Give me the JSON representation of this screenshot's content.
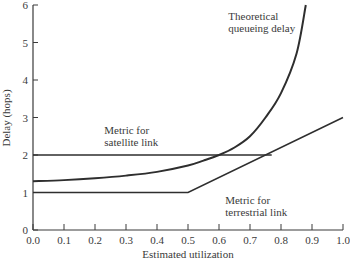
{
  "chart_data": {
    "type": "line",
    "title": "",
    "xlabel": "Estimated utilization",
    "ylabel": "Delay (hops)",
    "xlim": [
      0.0,
      1.0
    ],
    "ylim": [
      0,
      6
    ],
    "grid": false,
    "x_ticks": [
      "0.0",
      "0.1",
      "0.2",
      "0.3",
      "0.4",
      "0.5",
      "0.6",
      "0.7",
      "0.8",
      "0.9",
      "1.0"
    ],
    "y_ticks": [
      "0",
      "1",
      "2",
      "3",
      "4",
      "5",
      "6"
    ],
    "series": [
      {
        "name": "Theoretical queueing delay",
        "x": [
          0.0,
          0.1,
          0.2,
          0.3,
          0.4,
          0.5,
          0.55,
          0.6,
          0.65,
          0.7,
          0.75,
          0.8,
          0.85,
          0.88
        ],
        "values": [
          1.3,
          1.33,
          1.38,
          1.45,
          1.55,
          1.72,
          1.85,
          2.0,
          2.2,
          2.5,
          3.0,
          3.65,
          4.7,
          6.0
        ]
      },
      {
        "name": "Metric for satellite link",
        "x": [
          0.0,
          0.77
        ],
        "values": [
          2.0,
          2.0
        ]
      },
      {
        "name": "Metric for terrestrial link",
        "x": [
          0.0,
          0.5,
          1.0
        ],
        "values": [
          1.0,
          1.0,
          3.0
        ]
      }
    ],
    "annotations": [
      {
        "text": [
          "Theoretical",
          "queueing delay"
        ],
        "x": 0.63,
        "y": 5.6
      },
      {
        "text": [
          "Metric for",
          "satellite link"
        ],
        "x": 0.23,
        "y": 2.55
      },
      {
        "text": [
          "Metric for",
          "terrestrial link"
        ],
        "x": 0.62,
        "y": 0.7
      }
    ]
  }
}
